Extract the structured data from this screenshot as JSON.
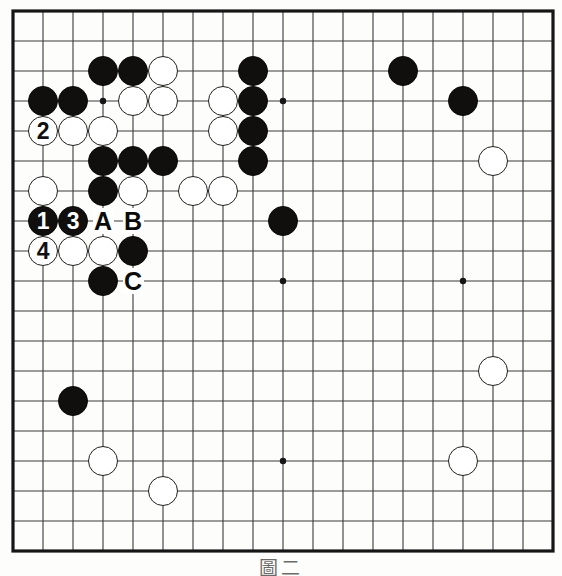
{
  "figure": {
    "kind": "go-board-diagram",
    "caption": "圖二",
    "board": {
      "size": 19,
      "visible_columns": 18,
      "visible_rows": 18,
      "origin_x": 13,
      "origin_y": 11,
      "spacing": 30,
      "grid_color": "#3a3a3a",
      "border_color": "#161616",
      "background": "#fdfdfc",
      "star_points": [
        {
          "col": 3,
          "row": 3
        },
        {
          "col": 9,
          "row": 3
        },
        {
          "col": 9,
          "row": 9
        },
        {
          "col": 15,
          "row": 9
        },
        {
          "col": 9,
          "row": 15
        },
        {
          "col": 15,
          "row": 15
        }
      ]
    },
    "colors": {
      "black_stone": "#100f0d",
      "white_stone": "#ffffff",
      "white_stone_edge": "#201f1d",
      "black_label": "#ffffff",
      "white_label": "#111111",
      "marker_text": "#0b0b0a"
    },
    "stones": [
      {
        "col": 3,
        "row": 2,
        "color": "black",
        "label": ""
      },
      {
        "col": 4,
        "row": 2,
        "color": "black",
        "label": ""
      },
      {
        "col": 5,
        "row": 2,
        "color": "white",
        "label": ""
      },
      {
        "col": 8,
        "row": 2,
        "color": "black",
        "label": ""
      },
      {
        "col": 13,
        "row": 2,
        "color": "black",
        "label": ""
      },
      {
        "col": 1,
        "row": 3,
        "color": "black",
        "label": ""
      },
      {
        "col": 2,
        "row": 3,
        "color": "black",
        "label": ""
      },
      {
        "col": 4,
        "row": 3,
        "color": "white",
        "label": ""
      },
      {
        "col": 5,
        "row": 3,
        "color": "white",
        "label": ""
      },
      {
        "col": 7,
        "row": 3,
        "color": "white",
        "label": ""
      },
      {
        "col": 8,
        "row": 3,
        "color": "black",
        "label": ""
      },
      {
        "col": 15,
        "row": 3,
        "color": "black",
        "label": ""
      },
      {
        "col": 1,
        "row": 4,
        "color": "white",
        "label": "2"
      },
      {
        "col": 2,
        "row": 4,
        "color": "white",
        "label": ""
      },
      {
        "col": 3,
        "row": 4,
        "color": "white",
        "label": ""
      },
      {
        "col": 7,
        "row": 4,
        "color": "white",
        "label": ""
      },
      {
        "col": 8,
        "row": 4,
        "color": "black",
        "label": ""
      },
      {
        "col": 3,
        "row": 5,
        "color": "black",
        "label": ""
      },
      {
        "col": 4,
        "row": 5,
        "color": "black",
        "label": ""
      },
      {
        "col": 5,
        "row": 5,
        "color": "black",
        "label": ""
      },
      {
        "col": 8,
        "row": 5,
        "color": "black",
        "label": ""
      },
      {
        "col": 16,
        "row": 5,
        "color": "white",
        "label": ""
      },
      {
        "col": 1,
        "row": 6,
        "color": "white",
        "label": ""
      },
      {
        "col": 3,
        "row": 6,
        "color": "black",
        "label": ""
      },
      {
        "col": 4,
        "row": 6,
        "color": "white",
        "label": ""
      },
      {
        "col": 6,
        "row": 6,
        "color": "white",
        "label": ""
      },
      {
        "col": 7,
        "row": 6,
        "color": "white",
        "label": ""
      },
      {
        "col": 1,
        "row": 7,
        "color": "black",
        "label": "1"
      },
      {
        "col": 2,
        "row": 7,
        "color": "black",
        "label": "3"
      },
      {
        "col": 9,
        "row": 7,
        "color": "black",
        "label": ""
      },
      {
        "col": 1,
        "row": 8,
        "color": "white",
        "label": "4"
      },
      {
        "col": 2,
        "row": 8,
        "color": "white",
        "label": ""
      },
      {
        "col": 3,
        "row": 8,
        "color": "white",
        "label": ""
      },
      {
        "col": 4,
        "row": 8,
        "color": "black",
        "label": ""
      },
      {
        "col": 3,
        "row": 9,
        "color": "black",
        "label": ""
      },
      {
        "col": 16,
        "row": 12,
        "color": "white",
        "label": ""
      },
      {
        "col": 2,
        "row": 13,
        "color": "black",
        "label": ""
      },
      {
        "col": 3,
        "row": 15,
        "color": "white",
        "label": ""
      },
      {
        "col": 15,
        "row": 15,
        "color": "white",
        "label": ""
      },
      {
        "col": 5,
        "row": 16,
        "color": "white",
        "label": ""
      }
    ],
    "markers": [
      {
        "col": 3,
        "row": 7,
        "text": "A"
      },
      {
        "col": 4,
        "row": 7,
        "text": "B"
      },
      {
        "col": 4,
        "row": 9,
        "text": "C"
      }
    ],
    "move_sequence": [
      {
        "number": "1",
        "color": "black"
      },
      {
        "number": "2",
        "color": "white"
      },
      {
        "number": "3",
        "color": "black"
      },
      {
        "number": "4",
        "color": "white"
      }
    ]
  }
}
